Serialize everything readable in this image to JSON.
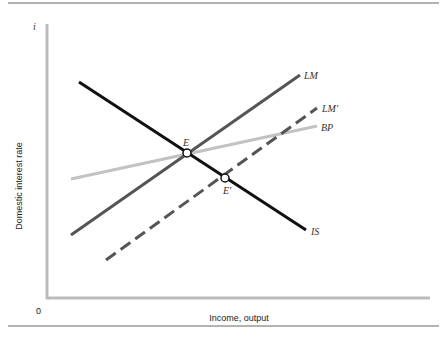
{
  "diagram": {
    "y_axis_symbol": "i",
    "y_axis_label": "Domestic interest rate",
    "x_axis_label": "Income, output",
    "origin_label": "0",
    "curves": [
      {
        "name": "IS",
        "label": "IS",
        "color": "#111111",
        "style": "solid"
      },
      {
        "name": "LM",
        "label": "LM",
        "color": "#555555",
        "style": "solid"
      },
      {
        "name": "LM'",
        "label": "LM'",
        "color": "#555555",
        "style": "dashed"
      },
      {
        "name": "BP",
        "label": "BP",
        "color": "#bbbbbb",
        "style": "solid"
      }
    ],
    "points": [
      {
        "name": "E",
        "label": "E"
      },
      {
        "name": "E'",
        "label": "E'"
      }
    ]
  }
}
